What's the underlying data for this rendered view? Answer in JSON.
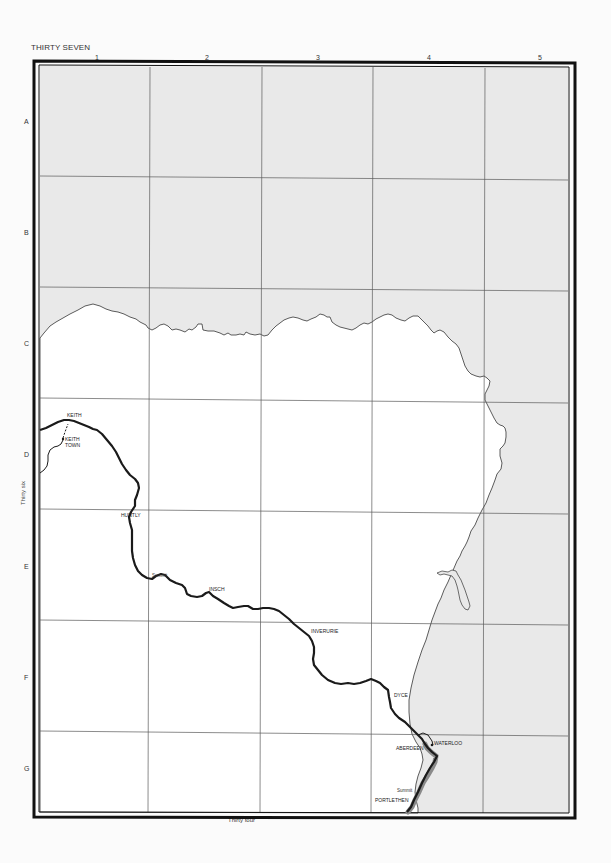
{
  "map": {
    "page_title": "THIRTY SEVEN",
    "columns": [
      "1",
      "2",
      "3",
      "4",
      "5"
    ],
    "rows": [
      "A",
      "B",
      "C",
      "D",
      "E",
      "F",
      "G"
    ],
    "adjacent_pages": {
      "west": "Thirty six",
      "south": "Thirty four"
    },
    "colors": {
      "sea": "#e9e9e9",
      "land": "#ffffff",
      "frame": "#111111",
      "grid": "#555555",
      "railway": "#1a1a1a",
      "railway_shadow": "#8a8a8a"
    },
    "places": [
      {
        "name": "KEITH",
        "x": 67,
        "y": 417
      },
      {
        "name": "KEITH",
        "x": 65,
        "y": 441
      },
      {
        "name": "TOWN",
        "x": 65,
        "y": 447
      },
      {
        "name": "HUNTLY",
        "x": 121,
        "y": 517
      },
      {
        "name": "Summit",
        "x": 152,
        "y": 577
      },
      {
        "name": "INSCH",
        "x": 209,
        "y": 591
      },
      {
        "name": "INVERURIE",
        "x": 311,
        "y": 633
      },
      {
        "name": "DYCE",
        "x": 394,
        "y": 697
      },
      {
        "name": "WATERLOO",
        "x": 434,
        "y": 745
      },
      {
        "name": "ABERDEEN",
        "x": 396,
        "y": 750
      },
      {
        "name": "Summit",
        "x": 397,
        "y": 792
      },
      {
        "name": "PORTLETHEN",
        "x": 375,
        "y": 802
      }
    ]
  }
}
